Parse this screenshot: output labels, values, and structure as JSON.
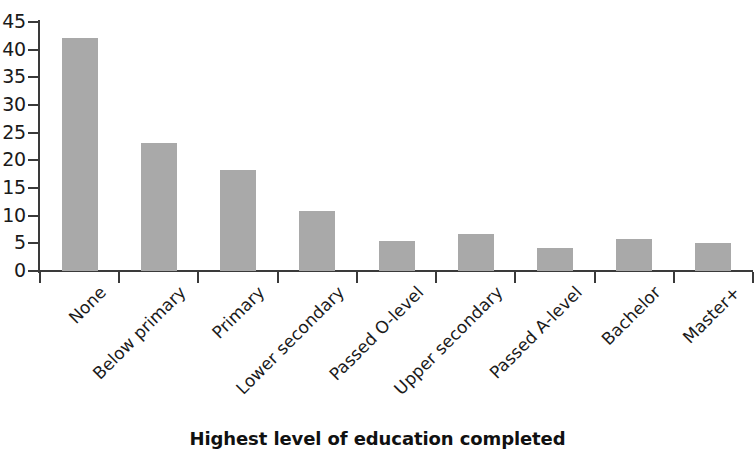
{
  "chart_data": {
    "type": "bar",
    "title": "",
    "xlabel": "Highest level of education completed",
    "ylabel": "",
    "categories": [
      "None",
      "Below primary",
      "Primary",
      "Lower secondary",
      "Passed O-level",
      "Upper secondary",
      "Passed A-level",
      "Bachelor",
      "Master+"
    ],
    "values": [
      42.2,
      23.2,
      18.3,
      10.9,
      5.4,
      6.6,
      4.1,
      5.7,
      5.0
    ],
    "ylim": [
      0,
      45
    ],
    "ytick_labels": [
      "0",
      "5",
      "10",
      "15",
      "20",
      "25",
      "30",
      "35",
      "40",
      "45"
    ],
    "ytick_values": [
      0,
      5,
      10,
      15,
      20,
      25,
      30,
      35,
      40,
      45
    ],
    "grid": false,
    "legend": null,
    "bar_color": "#a9a9a9",
    "axis_color": "#3a3a3a",
    "background_color": "#ffffff",
    "xtick_label_rotation": -45
  }
}
